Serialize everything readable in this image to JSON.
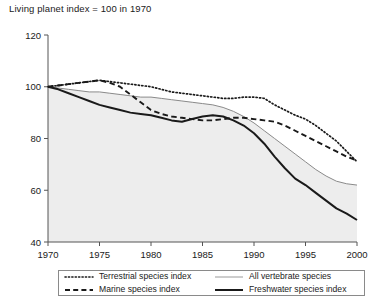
{
  "chart_data": {
    "type": "line",
    "title": "Living planet index = 100 in 1970",
    "xlabel": "",
    "ylabel": "",
    "xlim": [
      1970,
      2000
    ],
    "ylim": [
      40,
      120
    ],
    "yticks": [
      40,
      60,
      80,
      100,
      120
    ],
    "xticks": [
      1970,
      1975,
      1980,
      1985,
      1990,
      1995,
      2000
    ],
    "grid": false,
    "legend_position": "bottom",
    "x": [
      1970,
      1971,
      1972,
      1973,
      1974,
      1975,
      1976,
      1977,
      1978,
      1979,
      1980,
      1981,
      1982,
      1983,
      1984,
      1985,
      1986,
      1987,
      1988,
      1989,
      1990,
      1991,
      1992,
      1993,
      1994,
      1995,
      1996,
      1997,
      1998,
      1999,
      2000
    ],
    "series": [
      {
        "name": "Terrestrial species index",
        "style": "dotted",
        "color": "#1a1a1a",
        "values": [
          100,
          100.5,
          101,
          101.5,
          102,
          102.5,
          102,
          101.5,
          101,
          100.5,
          100,
          99,
          98,
          97.5,
          97,
          96.5,
          96,
          95.5,
          95.5,
          96,
          96,
          95.5,
          93,
          91,
          89,
          87.5,
          85,
          82,
          79,
          75,
          71
        ]
      },
      {
        "name": "All vertebrate species",
        "style": "solid-thin",
        "color": "#8a8a8a",
        "values": [
          100,
          99.5,
          99,
          98.5,
          98,
          98,
          97.5,
          97,
          96.5,
          96,
          96,
          95.5,
          95,
          94.5,
          94,
          93.5,
          93,
          92,
          90.5,
          88.5,
          86,
          83,
          80,
          77,
          74,
          71,
          68,
          65.5,
          63.5,
          62.5,
          62
        ]
      },
      {
        "name": "Marine species index",
        "style": "dashed",
        "color": "#1a1a1a",
        "values": [
          100,
          100.5,
          101,
          101.5,
          102,
          102.5,
          101.5,
          100,
          97,
          94,
          91,
          89.5,
          88.5,
          88,
          87.5,
          87,
          87,
          87.5,
          88,
          88,
          87.5,
          87,
          86.5,
          85,
          83,
          81,
          79,
          77,
          75,
          73,
          71.5
        ]
      },
      {
        "name": "Freshwater species index",
        "style": "solid-thick",
        "color": "#1a1a1a",
        "values": [
          100,
          99,
          97.5,
          96,
          94.5,
          93,
          92,
          91,
          90,
          89.5,
          89,
          88,
          87,
          86.5,
          87.5,
          88.5,
          89,
          88.5,
          87,
          85,
          82,
          78,
          73,
          68.5,
          64.5,
          62,
          59,
          56,
          53,
          51,
          48.5
        ]
      }
    ],
    "shaded_area": {
      "under_series": "All vertebrate species",
      "color": "#ededed"
    }
  },
  "legend": {
    "entries": [
      {
        "label": "Terrestrial species index",
        "style": "dotted"
      },
      {
        "label": "All vertebrate species",
        "style": "solid-thin"
      },
      {
        "label": "Marine species index",
        "style": "dashed"
      },
      {
        "label": "Freshwater species index",
        "style": "solid-thick"
      }
    ]
  },
  "axis": {
    "y_labels": [
      "120",
      "100",
      "80",
      "60",
      "40"
    ],
    "x_labels": [
      "1970",
      "1975",
      "1980",
      "1985",
      "1990",
      "1995",
      "2000"
    ]
  }
}
